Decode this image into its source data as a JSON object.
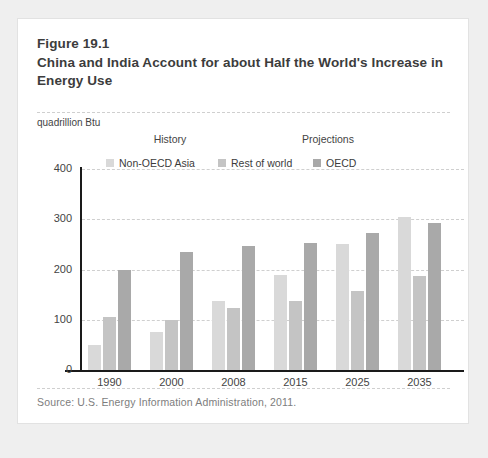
{
  "figure": {
    "number": "Figure 19.1",
    "title": "China and India Account for about Half the World's Increase in Energy Use",
    "source": "Source: U.S. Energy Information Administration, 2011."
  },
  "chart_data": {
    "type": "bar",
    "title": "China and India Account for about Half the World's Increase in Energy Use",
    "xlabel": "",
    "ylabel": "quadrillion Btu",
    "categories": [
      "1990",
      "2000",
      "2008",
      "2015",
      "2025",
      "2035"
    ],
    "series": [
      {
        "name": "Non-OECD Asia",
        "color": "#d9d9d9",
        "values": [
          50,
          75,
          138,
          190,
          250,
          305
        ]
      },
      {
        "name": "Rest of world",
        "color": "#c4c4c4",
        "values": [
          105,
          100,
          123,
          138,
          157,
          187
        ]
      },
      {
        "name": "OECD",
        "color": "#a9a9a9",
        "values": [
          200,
          235,
          247,
          253,
          272,
          292
        ]
      }
    ],
    "yticks": [
      0,
      100,
      200,
      300,
      400
    ],
    "ylim": [
      0,
      400
    ],
    "ytick_labels": [
      "0",
      "100",
      "200",
      "300",
      "400"
    ],
    "grid": true,
    "legend_position": "top",
    "annotations": [
      {
        "name": "history",
        "text": "History"
      },
      {
        "name": "projections",
        "text": "Projections"
      }
    ]
  },
  "colors": {
    "page_background": "#efefef",
    "card_background": "#ffffff",
    "axis": "#1a1a1a",
    "gridline": "#cfcfcf",
    "text": "#3c3c3c",
    "muted_text": "#7d7d7d"
  }
}
